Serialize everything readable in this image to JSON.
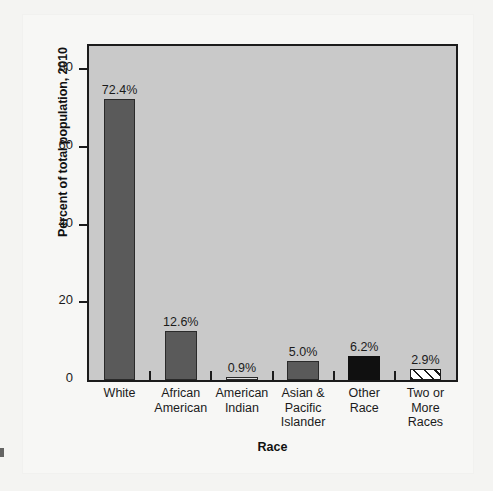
{
  "chart_data": {
    "type": "bar",
    "title": "",
    "xlabel": "Race",
    "ylabel": "Percent of total population, 2010",
    "categories": [
      "White",
      "African American",
      "American Indian",
      "Asian & Pacific Islander",
      "Other Race",
      "Two or More Races"
    ],
    "category_lines": [
      [
        "White"
      ],
      [
        "African",
        "American"
      ],
      [
        "American",
        "Indian"
      ],
      [
        "Asian &",
        "Pacific",
        "Islander"
      ],
      [
        "Other",
        "Race"
      ],
      [
        "Two or",
        "More",
        "Races"
      ]
    ],
    "values": [
      72.4,
      12.6,
      0.9,
      5.0,
      6.2,
      2.9
    ],
    "value_labels": [
      "72.4%",
      "12.6%",
      "0.9%",
      "5.0%",
      "6.2%",
      "2.9%"
    ],
    "bar_styles": [
      "gray",
      "gray",
      "light",
      "gray",
      "black",
      "hatch"
    ],
    "ylim": [
      0,
      86
    ],
    "yticks": [
      0,
      20,
      40,
      60,
      80
    ],
    "ytick_labels": [
      "0",
      "20",
      "40",
      "60",
      "80"
    ],
    "grid": false,
    "legend": "none"
  },
  "colors": {
    "bar_gray": "#5a5a5a",
    "bar_black": "#101010",
    "bar_light": "#dedede",
    "hatch_line": "#1b1b1b",
    "plot_background": "#c9c9c9",
    "page_background": "#f4f4f2",
    "axis": "#1b1b1b"
  }
}
